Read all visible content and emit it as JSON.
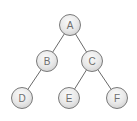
{
  "diagram": {
    "type": "binary-tree",
    "colors": {
      "node_fill_top": "#f7f7f7",
      "node_fill_bottom": "#d6d6d6",
      "node_stroke": "#7a7a7a",
      "edge": "#6a6a6a",
      "label": "#6e6e6e"
    },
    "nodes": [
      {
        "id": "A",
        "label": "A",
        "x": 70,
        "y": 25
      },
      {
        "id": "B",
        "label": "B",
        "x": 47,
        "y": 61
      },
      {
        "id": "C",
        "label": "C",
        "x": 92,
        "y": 61
      },
      {
        "id": "D",
        "label": "D",
        "x": 22,
        "y": 98
      },
      {
        "id": "E",
        "label": "E",
        "x": 69,
        "y": 98
      },
      {
        "id": "F",
        "label": "F",
        "x": 117,
        "y": 98
      }
    ],
    "edges": [
      {
        "from": "A",
        "to": "B"
      },
      {
        "from": "A",
        "to": "C"
      },
      {
        "from": "B",
        "to": "D"
      },
      {
        "from": "C",
        "to": "E"
      },
      {
        "from": "C",
        "to": "F"
      }
    ]
  }
}
